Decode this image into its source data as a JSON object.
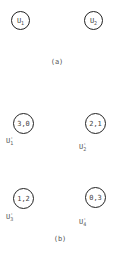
{
  "part_a": {
    "caption": "(a)",
    "nodes": [
      {
        "base": "U",
        "sub": "1"
      },
      {
        "base": "U",
        "sub": "2"
      }
    ]
  },
  "part_b": {
    "caption": "(b)",
    "nodes": [
      {
        "value": "3,0",
        "label_base": "U",
        "label_sup": "'",
        "label_sub": "1"
      },
      {
        "value": "2,1",
        "label_base": "U",
        "label_sup": "'",
        "label_sub": "2"
      },
      {
        "value": "1,2",
        "label_base": "U",
        "label_sup": "'",
        "label_sub": "3"
      },
      {
        "value": "0,3",
        "label_base": "U",
        "label_sup": "'",
        "label_sub": "4"
      }
    ]
  }
}
